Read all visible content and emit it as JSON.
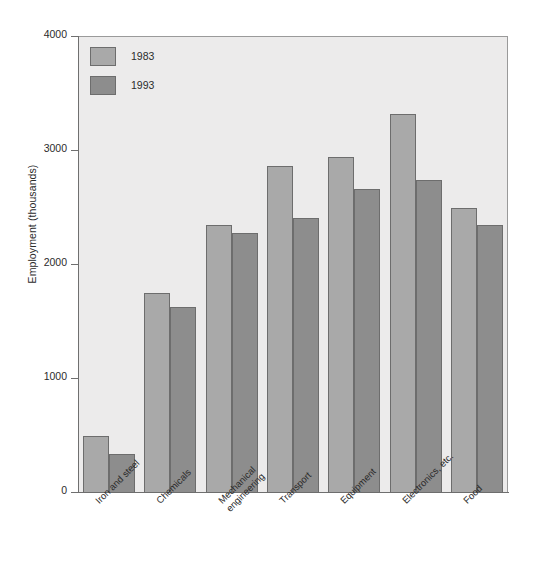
{
  "chart_data": {
    "type": "bar",
    "title": "",
    "subtitle": "",
    "xlabel": "",
    "ylabel": "Employment (thousands)",
    "ylim": [
      0,
      4000
    ],
    "yticks": [
      0,
      1000,
      2000,
      3000,
      4000
    ],
    "ytick_labels": [
      "0",
      "1000",
      "2000",
      "3000",
      "4000"
    ],
    "grid": false,
    "legend_position": "top-left",
    "categories": [
      "Iron and steel",
      "Chemicals",
      "Mechanical\nengineering",
      "Transport",
      "Equipment",
      "Electronics, etc.",
      "Food"
    ],
    "category_lines": [
      [
        "Iron and steel"
      ],
      [
        "Chemicals"
      ],
      [
        "Mechanical",
        "engineering"
      ],
      [
        "Transport"
      ],
      [
        "Equipment"
      ],
      [
        "Electronics, etc."
      ],
      [
        "Food"
      ]
    ],
    "series": [
      {
        "name": "1983",
        "color": "#a9a9a9",
        "values": [
          490,
          1750,
          2340,
          2860,
          2940,
          3320,
          2490
        ]
      },
      {
        "name": "1993",
        "color": "#8d8d8d",
        "values": [
          330,
          1620,
          2270,
          2400,
          2660,
          2740,
          2340
        ]
      }
    ]
  },
  "legend": {
    "entries": [
      {
        "label": "1983",
        "swatch": "light-gray-swatch"
      },
      {
        "label": "1993",
        "swatch": "dark-gray-swatch"
      }
    ]
  },
  "colors": {
    "series_1983": "#a9a9a9",
    "series_1993": "#8d8d8d",
    "plot_background": "#ecebeb",
    "page_background": "#ffffff",
    "axis": "#6f6f6f",
    "bar_border": "#6d6d6d",
    "text": "#2b2b2b"
  }
}
